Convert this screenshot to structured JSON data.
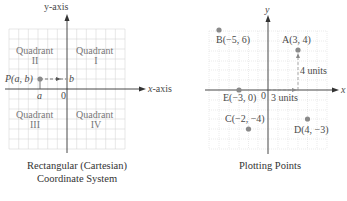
{
  "left_diagram": {
    "y_axis_label": "y-axis",
    "x_axis_label": "x-axis",
    "origin_label": "0",
    "quadrants": [
      {
        "word": "Quadrant",
        "numeral": "I"
      },
      {
        "word": "Quadrant",
        "numeral": "II"
      },
      {
        "word": "Quadrant",
        "numeral": "III"
      },
      {
        "word": "Quadrant",
        "numeral": "IV"
      }
    ],
    "point_label": "P(a, b)",
    "a_label": "a",
    "b_label": "b",
    "caption_line1": "Rectangular (Cartesian)",
    "caption_line2": "Coordinate System"
  },
  "right_diagram": {
    "y_axis_label": "y",
    "x_axis_label": "x",
    "origin_label": "0",
    "points": [
      {
        "name": "A",
        "label": "A(3, 4)",
        "x": 3,
        "y": 4
      },
      {
        "name": "B",
        "label": "B(−5, 6)",
        "x": -5,
        "y": 6
      },
      {
        "name": "C",
        "label": "C(−2, −4)",
        "x": -2,
        "y": -4
      },
      {
        "name": "D",
        "label": "D(4, −3)",
        "x": 4,
        "y": -3
      },
      {
        "name": "E",
        "label": "E(−3, 0)",
        "x": -3,
        "y": 0
      }
    ],
    "horizontal_units_label": "3 units",
    "vertical_units_label": "4 units",
    "caption": "Plotting Points"
  },
  "colors": {
    "grid": "#d4d4d4",
    "axis": "#333333",
    "point": "#8a8a8a",
    "text": "#4a4a4a"
  }
}
